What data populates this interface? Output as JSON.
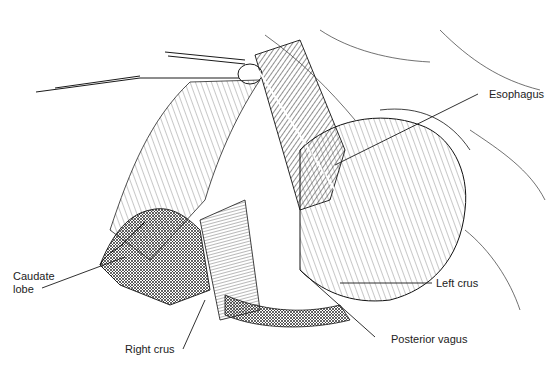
{
  "figure": {
    "labels": {
      "esophagus": "Esophagus",
      "caudate_lobe_line1": "Caudate",
      "caudate_lobe_line2": "lobe",
      "left_crus": "Left crus",
      "right_crus": "Right crus",
      "posterior_vagus": "Posterior vagus"
    },
    "colors": {
      "ink": "#1a1a1a",
      "background": "#ffffff"
    }
  }
}
